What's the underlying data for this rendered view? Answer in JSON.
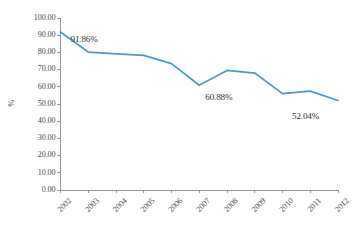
{
  "chart_data": {
    "type": "line",
    "title": "",
    "xlabel": "",
    "ylabel": "%",
    "ylim": [
      0,
      100
    ],
    "ytick_step": 10,
    "grid": false,
    "legend": "none",
    "line_color": "#4a9bc9",
    "axis_color": "#8d8d8d",
    "categories": [
      "2002",
      "2003",
      "2004",
      "2005",
      "2006",
      "2007",
      "2008",
      "2009",
      "2010",
      "2011",
      "2012"
    ],
    "ytick_labels": [
      "0.00",
      "10.00",
      "20.00",
      "30.00",
      "40.00",
      "50.00",
      "60.00",
      "70.00",
      "80.00",
      "90.00",
      "100.00"
    ],
    "series": [
      {
        "name": "percentage",
        "values": [
          91.86,
          80.2,
          79.2,
          78.3,
          73.5,
          60.88,
          69.5,
          68.0,
          56.0,
          57.5,
          52.04
        ]
      }
    ],
    "annotations": [
      {
        "text": "91.86%",
        "category": "2002",
        "value": 91.86
      },
      {
        "text": "60.88%",
        "category": "2007",
        "value": 60.88
      },
      {
        "text": "52.04%",
        "category": "2012",
        "value": 52.04
      }
    ]
  }
}
